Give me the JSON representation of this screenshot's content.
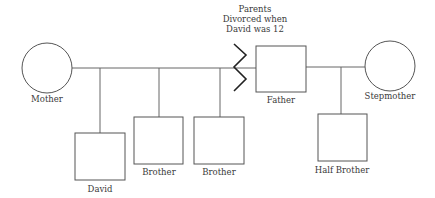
{
  "diagram": {
    "type": "genogram",
    "annotation": {
      "lines": [
        "Parents",
        "Divorced when",
        "David was 12"
      ]
    },
    "people": {
      "mother": {
        "label": "Mother",
        "shape": "circle"
      },
      "father": {
        "label": "Father",
        "shape": "square"
      },
      "stepmother": {
        "label": "Stepmother",
        "shape": "circle"
      },
      "david": {
        "label": "David",
        "shape": "square"
      },
      "brother1": {
        "label": "Brother",
        "shape": "square"
      },
      "brother2": {
        "label": "Brother",
        "shape": "square"
      },
      "half_brother": {
        "label": "Half Brother",
        "shape": "square"
      }
    },
    "relationships": [
      {
        "from": "Mother",
        "to": "Father",
        "type": "divorced"
      },
      {
        "from": "Father",
        "to": "Stepmother",
        "type": "married"
      }
    ],
    "colors": {
      "line": "#666666",
      "zigzag": "#222222",
      "text": "#3a3a3a"
    }
  }
}
